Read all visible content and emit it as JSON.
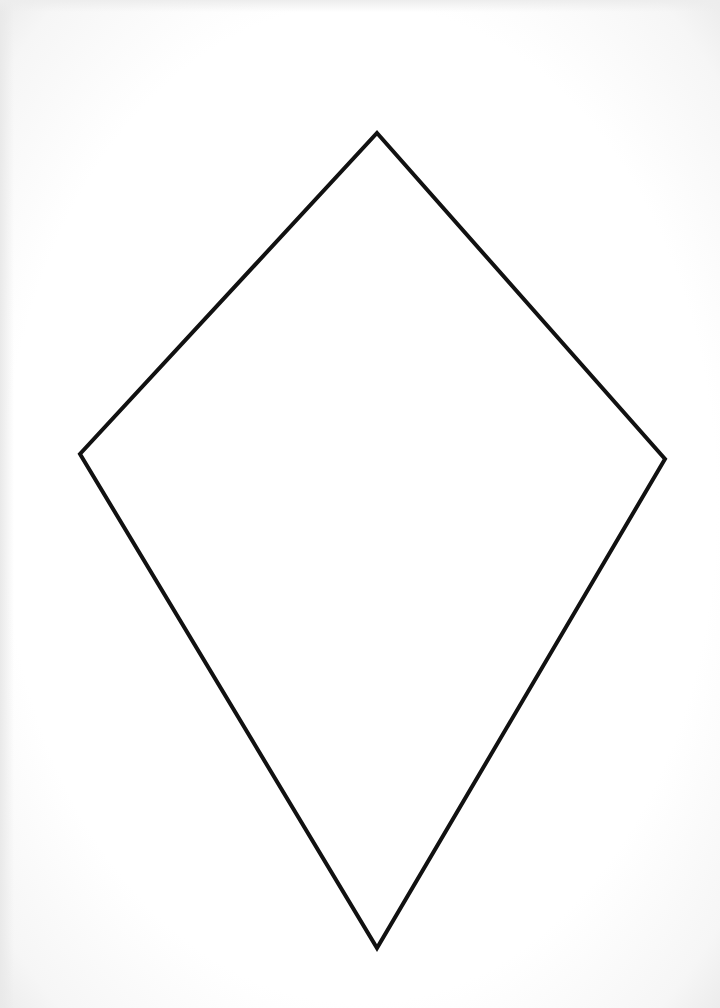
{
  "page": {
    "background_color": "#ffffff",
    "edge_shade_color": "#ececec"
  },
  "shape": {
    "type": "kite",
    "stroke_color": "#111111",
    "stroke_width": 4,
    "fill_color": "none",
    "vertices": {
      "top": [
        377,
        133
      ],
      "right": [
        665,
        459
      ],
      "bottom": [
        377,
        948
      ],
      "left": [
        80,
        454
      ]
    },
    "points": "377,133 665,459 377,948 80,454"
  }
}
